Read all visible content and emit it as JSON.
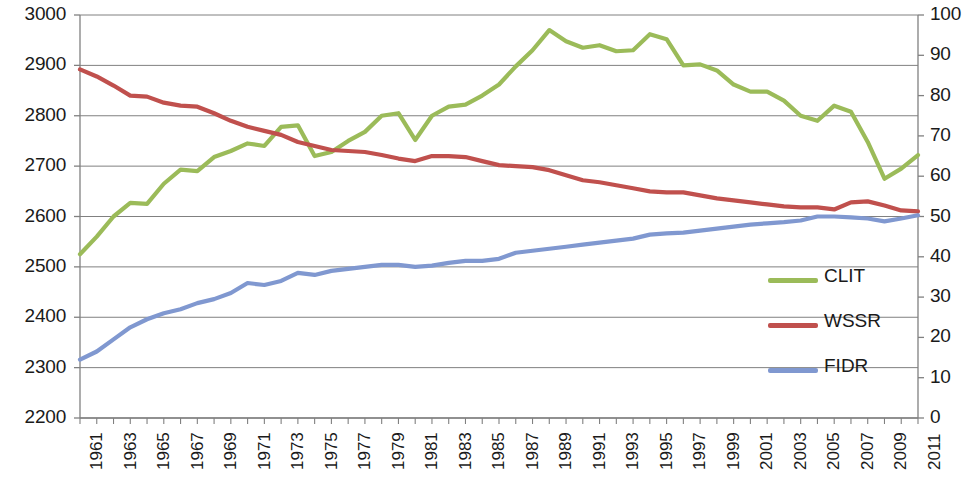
{
  "chart_data": {
    "type": "line",
    "title": "",
    "xlabel": "",
    "ylabel": "",
    "y2label": "",
    "grid": true,
    "legend_position": "right-middle",
    "x": [
      1961,
      1962,
      1963,
      1964,
      1965,
      1966,
      1967,
      1968,
      1969,
      1970,
      1971,
      1972,
      1973,
      1974,
      1975,
      1976,
      1977,
      1978,
      1979,
      1980,
      1981,
      1982,
      1983,
      1984,
      1985,
      1986,
      1987,
      1988,
      1989,
      1990,
      1991,
      1992,
      1993,
      1994,
      1995,
      1996,
      1997,
      1998,
      1999,
      2000,
      2001,
      2002,
      2003,
      2004,
      2005,
      2006,
      2007,
      2008,
      2009,
      2010,
      2011
    ],
    "xtick_labels": [
      "1961",
      "1963",
      "1965",
      "1967",
      "1969",
      "1971",
      "1973",
      "1975",
      "1977",
      "1979",
      "1981",
      "1983",
      "1985",
      "1987",
      "1989",
      "1991",
      "1993",
      "1995",
      "1997",
      "1999",
      "2001",
      "2003",
      "2005",
      "2007",
      "2009",
      "2011"
    ],
    "xtick_step": 2,
    "ylim": [
      2200,
      3000
    ],
    "ytick_labels": [
      "2200",
      "2300",
      "2400",
      "2500",
      "2600",
      "2700",
      "2800",
      "2900",
      "3000"
    ],
    "y2lim": [
      0,
      100
    ],
    "y2tick_labels": [
      "0",
      "10",
      "20",
      "30",
      "40",
      "50",
      "60",
      "70",
      "80",
      "90",
      "100"
    ],
    "series": [
      {
        "name": "CLIT",
        "axis": "left",
        "color": "#9BBB59",
        "values": [
          2525,
          2560,
          2600,
          2627,
          2625,
          2665,
          2693,
          2690,
          2718,
          2730,
          2745,
          2740,
          2778,
          2781,
          2720,
          2728,
          2750,
          2768,
          2800,
          2805,
          2752,
          2800,
          2818,
          2822,
          2840,
          2862,
          2898,
          2930,
          2970,
          2948,
          2935,
          2940,
          2928,
          2930,
          2962,
          2952,
          2900,
          2902,
          2890,
          2862,
          2848,
          2848,
          2830,
          2800,
          2790,
          2820,
          2808,
          2748,
          2675,
          2695,
          2722
        ]
      },
      {
        "name": "WSSR",
        "axis": "left",
        "color": "#C0504D",
        "values": [
          2892,
          2878,
          2860,
          2840,
          2838,
          2826,
          2820,
          2818,
          2805,
          2790,
          2778,
          2770,
          2762,
          2748,
          2740,
          2732,
          2730,
          2728,
          2722,
          2715,
          2710,
          2720,
          2720,
          2718,
          2710,
          2702,
          2700,
          2698,
          2692,
          2682,
          2672,
          2668,
          2662,
          2656,
          2650,
          2648,
          2648,
          2642,
          2636,
          2632,
          2628,
          2624,
          2620,
          2618,
          2618,
          2614,
          2628,
          2630,
          2622,
          2612,
          2610
        ]
      },
      {
        "name": "FIDR",
        "axis": "right",
        "color": "#8098D0",
        "values": [
          14.5,
          16.5,
          19.5,
          22.5,
          24.5,
          26,
          27,
          28.5,
          29.5,
          31,
          33.5,
          33,
          34,
          36,
          35.5,
          36.5,
          37,
          37.5,
          38,
          38,
          37.5,
          37.8,
          38.5,
          39,
          39,
          39.5,
          41,
          41.5,
          42,
          42.5,
          43,
          43.5,
          44,
          44.5,
          45.5,
          45.8,
          46,
          46.5,
          47,
          47.5,
          48,
          48.3,
          48.6,
          49,
          50,
          50,
          49.8,
          49.5,
          48.8,
          49.5,
          50.3
        ]
      }
    ]
  },
  "legend": {
    "items": [
      {
        "label": "CLIT",
        "color": "#9BBB59"
      },
      {
        "label": "WSSR",
        "color": "#C0504D"
      },
      {
        "label": "FIDR",
        "color": "#8098D0"
      }
    ]
  }
}
